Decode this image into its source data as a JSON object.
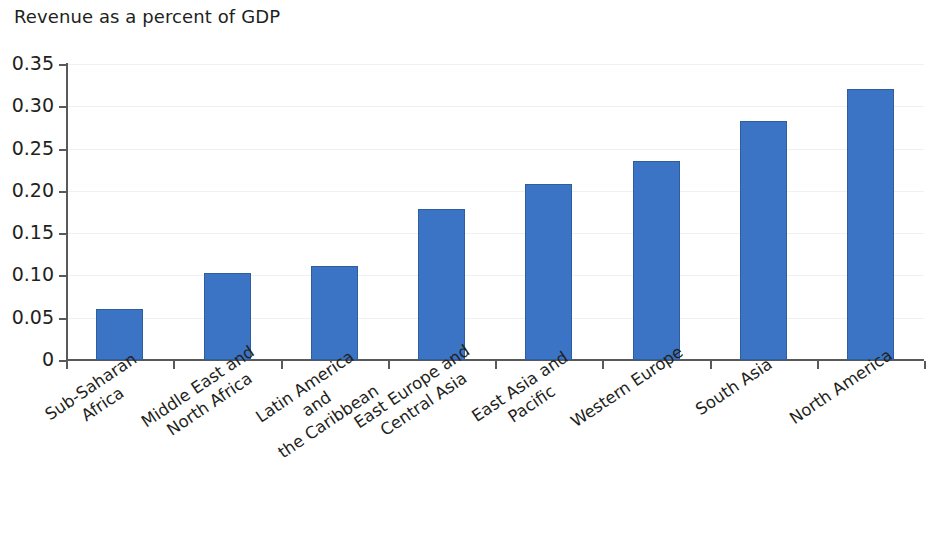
{
  "chart_data": {
    "type": "bar",
    "title": "Revenue as a percent of GDP",
    "subtitle": "",
    "xlabel": "",
    "ylabel": "",
    "ylim": [
      0,
      0.35
    ],
    "yticks": [
      0,
      0.05,
      0.1,
      0.15,
      0.2,
      0.25,
      0.3,
      0.35
    ],
    "ytick_labels": [
      "0",
      "0.05",
      "0.10",
      "0.15",
      "0.20",
      "0.25",
      "0.30",
      "0.35"
    ],
    "grid": true,
    "legend": "none",
    "bar_color": "#3b74c4",
    "bar_edge_color": "#2f5e9e",
    "axis_color": "#58595b",
    "categories": [
      "Sub-Saharan\nAfrica",
      "Middle East and\nNorth Africa",
      "Latin America and\nthe Caribbean",
      "East Europe and\nCentral Asia",
      "East Asia and Pacific",
      "Western Europe",
      "South Asia",
      "North America"
    ],
    "values": [
      0.06,
      0.103,
      0.111,
      0.178,
      0.208,
      0.235,
      0.283,
      0.32
    ]
  }
}
